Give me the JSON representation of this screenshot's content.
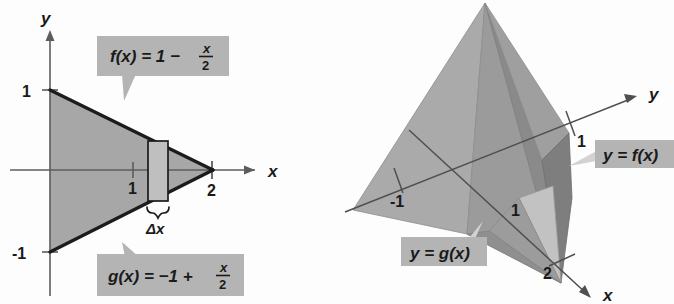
{
  "figure": {
    "panels": [
      {
        "id": "panel-2d",
        "kind": "plane-region-with-representative-rectangle",
        "axes": {
          "x_axis_label": "x",
          "y_axis_label": "y",
          "x_ticks": [
            "1",
            "2"
          ],
          "y_ticks": [
            "1",
            "-1"
          ]
        },
        "callouts": [
          {
            "name": "f-callout",
            "lhs": "f(x) = 1 −",
            "fraction_numerator": "x",
            "fraction_denominator": "2",
            "full_text": "f(x) = 1 − x/2"
          },
          {
            "name": "g-callout",
            "lhs": "g(x) = −1 +",
            "fraction_numerator": "x",
            "fraction_denominator": "2",
            "full_text": "g(x) = −1 + x/2"
          }
        ],
        "slice": {
          "label": "Δx",
          "description": "representative vertical rectangle"
        }
      },
      {
        "id": "panel-3d",
        "kind": "solid-of-revolution-slice-view",
        "axes": {
          "x_axis_label": "x",
          "y_axis_label": "y",
          "tick_labels": [
            "1",
            "-1",
            "1",
            "2"
          ]
        },
        "callouts": [
          {
            "name": "f-surface-callout",
            "text": "y = f(x)"
          },
          {
            "name": "g-surface-callout",
            "text": "y = g(x)"
          }
        ]
      }
    ],
    "colors": {
      "region_fill": "#a7a7a7",
      "callout_bg": "#b4b4b4",
      "slice_fill": "#bfbfbf",
      "outline": "#1c1c1c",
      "axis": "#5c5c5c",
      "face_light": "#b0b0b0",
      "face_mid": "#9a9a9a",
      "face_dark": "#7e7e7e",
      "face_darkest": "#6c6c6c",
      "background": "#fdfdfd"
    }
  }
}
